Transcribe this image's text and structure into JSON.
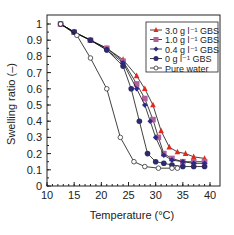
{
  "chart_data": {
    "type": "line",
    "title": "",
    "xlabel": "Temperature (°C)",
    "ylabel": "Swelling ratio (–)",
    "xlim": [
      10,
      40
    ],
    "ylim": [
      0,
      1.05
    ],
    "xticks": [
      10,
      15,
      20,
      25,
      30,
      35,
      40
    ],
    "yticks": [
      0,
      0.1,
      0.2,
      0.3,
      0.4,
      0.5,
      0.6,
      0.7,
      0.8,
      0.9,
      1
    ],
    "grid": false,
    "legend_position": "upper right",
    "series": [
      {
        "name": "3.0 g l⁻¹ GBS",
        "marker": "triangle",
        "color": "#e02a1c",
        "x": [
          12.5,
          15,
          18,
          21,
          24,
          26.5,
          28,
          29.5,
          31,
          32.5,
          34,
          35.5,
          37,
          39
        ],
        "y": [
          1,
          0.95,
          0.9,
          0.85,
          0.78,
          0.68,
          0.6,
          0.5,
          0.34,
          0.24,
          0.21,
          0.2,
          0.18,
          0.17
        ]
      },
      {
        "name": "1.0 g l⁻¹ GBS",
        "marker": "square",
        "color": "#b0609a",
        "x": [
          12.5,
          15,
          18,
          21,
          24,
          26.5,
          28,
          29.5,
          30.5,
          31.5,
          33,
          35,
          37,
          39
        ],
        "y": [
          1,
          0.95,
          0.9,
          0.85,
          0.77,
          0.63,
          0.54,
          0.41,
          0.3,
          0.2,
          0.17,
          0.15,
          0.15,
          0.15
        ]
      },
      {
        "name": "0.4 g l⁻¹ GBS",
        "marker": "diamond",
        "color": "#2a2a8a",
        "x": [
          12.5,
          15,
          18,
          21,
          24,
          26.5,
          28,
          29,
          30,
          31.5,
          33,
          35,
          37,
          39
        ],
        "y": [
          1,
          0.95,
          0.9,
          0.84,
          0.76,
          0.6,
          0.5,
          0.4,
          0.3,
          0.19,
          0.16,
          0.15,
          0.14,
          0.14
        ]
      },
      {
        "name": "0 g l⁻¹ GBS",
        "marker": "circle",
        "color": "#2b2b6e",
        "x": [
          12.5,
          15,
          18,
          21,
          24,
          25.5,
          27,
          28.5,
          30,
          31.5,
          33,
          35,
          37,
          39
        ],
        "y": [
          1,
          0.95,
          0.9,
          0.84,
          0.74,
          0.6,
          0.4,
          0.2,
          0.15,
          0.14,
          0.13,
          0.12,
          0.12,
          0.12
        ]
      },
      {
        "name": "Pure water",
        "marker": "open-circle",
        "color": "#333333",
        "x": [
          12.5,
          15.5,
          18,
          21,
          23.5,
          26,
          28,
          30.5,
          33,
          34
        ],
        "y": [
          1,
          0.93,
          0.79,
          0.6,
          0.3,
          0.15,
          0.12,
          0.11,
          0.11,
          0.11
        ]
      }
    ]
  }
}
